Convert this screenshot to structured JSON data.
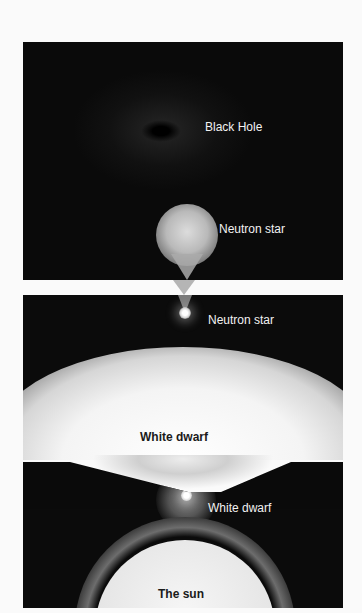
{
  "diagram": {
    "type": "stellar-evolution-illustration",
    "panels": [
      {
        "id": "panel-1",
        "objects": [
          "black-hole",
          "neutron-star-progenitor"
        ],
        "labels": [
          "Black Hole",
          "Neutron star"
        ]
      },
      {
        "id": "panel-2",
        "objects": [
          "neutron-star",
          "white-dwarf-progenitor"
        ],
        "labels": [
          "Neutron star",
          "White dwarf"
        ]
      },
      {
        "id": "panel-3",
        "objects": [
          "white-dwarf",
          "sun"
        ],
        "labels": [
          "White dwarf",
          "The sun"
        ]
      }
    ]
  },
  "labels": {
    "black_hole": "Black Hole",
    "neutron_star_top": "Neutron star",
    "neutron_star_mid": "Neutron star",
    "white_dwarf_mid": "White dwarf",
    "white_dwarf_bottom": "White dwarf",
    "sun": "The sun"
  },
  "colors": {
    "space": "#0b0b0b",
    "background": "#fafafa",
    "label_light": "#f2f2f2",
    "label_dark": "#1a1a1a"
  }
}
